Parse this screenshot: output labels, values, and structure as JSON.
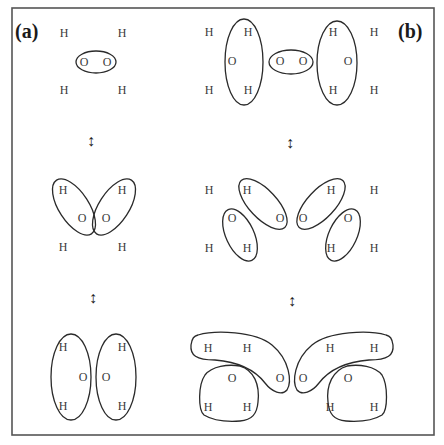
{
  "figure": {
    "panels": [
      {
        "id": "a",
        "label": "(a)"
      },
      {
        "id": "b",
        "label": "(b)"
      }
    ],
    "arrow_glyph": "↕",
    "atoms": {
      "hydrogen": "H",
      "oxygen": "O"
    },
    "colors": {
      "frame": "#555555",
      "ink": "#2a2a2a",
      "atom_text": "#3a3a3a",
      "background": "#ffffff"
    },
    "panel_a": {
      "structures": [
        {
          "name": "top",
          "atoms": [
            {
              "el": "H",
              "x": 64,
              "y": 37
            },
            {
              "el": "H",
              "x": 122,
              "y": 37
            },
            {
              "el": "O",
              "x": 84,
              "y": 66
            },
            {
              "el": "O",
              "x": 107,
              "y": 66
            },
            {
              "el": "H",
              "x": 64,
              "y": 94
            },
            {
              "el": "H",
              "x": 122,
              "y": 94
            }
          ]
        },
        {
          "name": "middle",
          "atoms": [
            {
              "el": "H",
              "x": 63,
              "y": 194
            },
            {
              "el": "H",
              "x": 122,
              "y": 194
            },
            {
              "el": "O",
              "x": 82,
              "y": 222
            },
            {
              "el": "O",
              "x": 106,
              "y": 222
            },
            {
              "el": "H",
              "x": 63,
              "y": 251
            },
            {
              "el": "H",
              "x": 122,
              "y": 251
            }
          ]
        },
        {
          "name": "bottom",
          "atoms": [
            {
              "el": "H",
              "x": 63,
              "y": 351
            },
            {
              "el": "H",
              "x": 122,
              "y": 351
            },
            {
              "el": "O",
              "x": 83,
              "y": 381
            },
            {
              "el": "O",
              "x": 106,
              "y": 381
            },
            {
              "el": "H",
              "x": 63,
              "y": 410
            },
            {
              "el": "H",
              "x": 122,
              "y": 410
            }
          ]
        }
      ]
    },
    "panel_b": {
      "structures": [
        {
          "name": "top",
          "atoms": [
            {
              "el": "H",
              "x": 209,
              "y": 36
            },
            {
              "el": "H",
              "x": 248,
              "y": 36
            },
            {
              "el": "H",
              "x": 333,
              "y": 36
            },
            {
              "el": "H",
              "x": 374,
              "y": 36
            },
            {
              "el": "O",
              "x": 232,
              "y": 65
            },
            {
              "el": "O",
              "x": 280,
              "y": 65
            },
            {
              "el": "O",
              "x": 303,
              "y": 65
            },
            {
              "el": "O",
              "x": 348,
              "y": 65
            },
            {
              "el": "H",
              "x": 209,
              "y": 94
            },
            {
              "el": "H",
              "x": 248,
              "y": 94
            },
            {
              "el": "H",
              "x": 333,
              "y": 94
            },
            {
              "el": "H",
              "x": 374,
              "y": 94
            }
          ]
        },
        {
          "name": "middle",
          "atoms": [
            {
              "el": "H",
              "x": 209,
              "y": 194
            },
            {
              "el": "H",
              "x": 247,
              "y": 194
            },
            {
              "el": "H",
              "x": 331,
              "y": 194
            },
            {
              "el": "H",
              "x": 374,
              "y": 194
            },
            {
              "el": "O",
              "x": 232,
              "y": 222
            },
            {
              "el": "O",
              "x": 280,
              "y": 222
            },
            {
              "el": "O",
              "x": 303,
              "y": 222
            },
            {
              "el": "O",
              "x": 348,
              "y": 222
            },
            {
              "el": "H",
              "x": 209,
              "y": 252
            },
            {
              "el": "H",
              "x": 247,
              "y": 252
            },
            {
              "el": "H",
              "x": 331,
              "y": 252
            },
            {
              "el": "H",
              "x": 374,
              "y": 252
            }
          ]
        },
        {
          "name": "bottom",
          "atoms": [
            {
              "el": "H",
              "x": 208,
              "y": 352
            },
            {
              "el": "H",
              "x": 247,
              "y": 352
            },
            {
              "el": "H",
              "x": 330,
              "y": 352
            },
            {
              "el": "H",
              "x": 374,
              "y": 352
            },
            {
              "el": "O",
              "x": 232,
              "y": 382
            },
            {
              "el": "O",
              "x": 280,
              "y": 382
            },
            {
              "el": "O",
              "x": 303,
              "y": 382
            },
            {
              "el": "O",
              "x": 348,
              "y": 382
            },
            {
              "el": "H",
              "x": 208,
              "y": 411
            },
            {
              "el": "H",
              "x": 247,
              "y": 411
            },
            {
              "el": "H",
              "x": 330,
              "y": 411
            },
            {
              "el": "H",
              "x": 374,
              "y": 411
            }
          ]
        }
      ]
    },
    "arrows": [
      {
        "panel": "a",
        "x": 91,
        "y": 146
      },
      {
        "panel": "b",
        "x": 290,
        "y": 148
      },
      {
        "panel": "a",
        "x": 93,
        "y": 303
      },
      {
        "panel": "b",
        "x": 292,
        "y": 306
      }
    ]
  }
}
